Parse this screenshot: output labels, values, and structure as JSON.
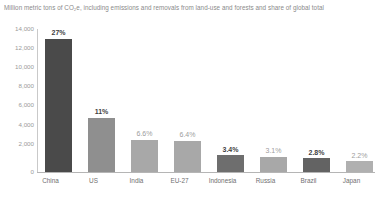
{
  "chart_data": {
    "type": "bar",
    "title": "Million metric tons of CO₂e, including emissions and removals from land-use and forests and share of global total",
    "xlabel": "",
    "ylabel": "",
    "ylim": [
      0,
      15000
    ],
    "grid": false,
    "legend": "none",
    "categories": [
      "China",
      "US",
      "India",
      "EU-27",
      "Indonesia",
      "Russia",
      "Brazil",
      "Japan"
    ],
    "values": [
      14000,
      5700,
      3400,
      3300,
      1750,
      1600,
      1450,
      1150
    ],
    "y_ticks": [
      "0",
      "2,000",
      "4,000",
      "6,000",
      "8,000",
      "10,000",
      "12,000",
      "14,000"
    ],
    "y_tick_values": [
      0,
      2000,
      4000,
      6000,
      8000,
      10000,
      12000,
      14000
    ],
    "data_labels": [
      "27%",
      "11%",
      "6.6%",
      "6.4%",
      "3.4%",
      "3.1%",
      "2.8%",
      "2.2%"
    ],
    "share_of_global_total_percent": [
      27,
      11,
      6.6,
      6.4,
      3.4,
      3.1,
      2.8,
      2.2
    ],
    "bar_colors": [
      "#4a4a4a",
      "#8f8f8f",
      "#a8a8a8",
      "#a8a8a8",
      "#6e6e6e",
      "#a8a8a8",
      "#636363",
      "#b0b0b0"
    ],
    "label_emphasis": [
      "dark",
      "dark",
      "light",
      "light",
      "dark",
      "light",
      "dark",
      "light"
    ]
  },
  "colors": {
    "background": "#ffffff",
    "axis": "#b5b5b5",
    "title_text": "#8a8a8a",
    "tick_text": "#9a9a9a",
    "category_text": "#6f6f6f",
    "label_dark": "#3f3f3f",
    "label_light": "#9d9d9d"
  }
}
